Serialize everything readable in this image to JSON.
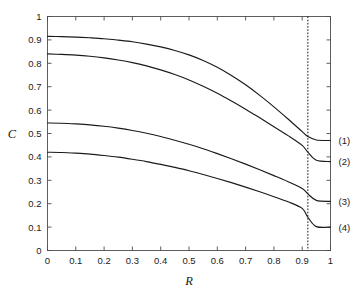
{
  "chart_data": {
    "type": "line",
    "title": "",
    "xlabel": "R",
    "ylabel": "C",
    "xlim": [
      0,
      1
    ],
    "ylim": [
      0,
      1
    ],
    "grid": false,
    "legend": "inline-right-labels",
    "xticks": [
      0,
      0.1,
      0.2,
      0.3,
      0.4,
      0.5,
      0.6,
      0.7,
      0.8,
      0.9,
      1
    ],
    "xticklabels": [
      "0",
      "0.1",
      "0.2",
      "0.3",
      "0.4",
      "0.5",
      "0.6",
      "0.7",
      "0.8",
      "0.9",
      "1"
    ],
    "yticks": [
      0,
      0.1,
      0.2,
      0.3,
      0.4,
      0.5,
      0.6,
      0.7,
      0.8,
      0.9,
      1
    ],
    "yticklabels": [
      "0",
      "0.1",
      "0.2",
      "0.3",
      "0.4",
      "0.5",
      "0.6",
      "0.7",
      "0.8",
      "0.9",
      "1"
    ],
    "annotations": [
      {
        "name": "vertical-dotted-line",
        "type": "vline",
        "x": 0.92,
        "style": "dotted"
      }
    ],
    "x": [
      0,
      0.05,
      0.1,
      0.15,
      0.2,
      0.25,
      0.3,
      0.35,
      0.4,
      0.45,
      0.5,
      0.55,
      0.6,
      0.65,
      0.7,
      0.75,
      0.8,
      0.85,
      0.9,
      0.92,
      0.95,
      1
    ],
    "series": [
      {
        "name": "(1)",
        "label": "(1)",
        "color": "#1a1a1a",
        "values": [
          0.915,
          0.914,
          0.912,
          0.909,
          0.905,
          0.899,
          0.892,
          0.882,
          0.87,
          0.855,
          0.836,
          0.812,
          0.783,
          0.748,
          0.708,
          0.663,
          0.614,
          0.562,
          0.508,
          0.487,
          0.472,
          0.47
        ]
      },
      {
        "name": "(2)",
        "label": "(2)",
        "color": "#1a1a1a",
        "values": [
          0.84,
          0.838,
          0.835,
          0.83,
          0.823,
          0.814,
          0.803,
          0.789,
          0.772,
          0.752,
          0.729,
          0.702,
          0.672,
          0.639,
          0.604,
          0.567,
          0.529,
          0.491,
          0.449,
          0.42,
          0.386,
          0.38
        ]
      },
      {
        "name": "(3)",
        "label": "(3)",
        "color": "#1a1a1a",
        "values": [
          0.545,
          0.544,
          0.541,
          0.537,
          0.531,
          0.523,
          0.513,
          0.501,
          0.487,
          0.471,
          0.454,
          0.435,
          0.414,
          0.392,
          0.369,
          0.345,
          0.32,
          0.294,
          0.265,
          0.242,
          0.214,
          0.21
        ]
      },
      {
        "name": "(4)",
        "label": "(4)",
        "color": "#1a1a1a",
        "values": [
          0.42,
          0.419,
          0.416,
          0.412,
          0.406,
          0.399,
          0.39,
          0.38,
          0.368,
          0.355,
          0.341,
          0.325,
          0.308,
          0.29,
          0.271,
          0.251,
          0.23,
          0.208,
          0.18,
          0.142,
          0.102,
          0.1
        ]
      }
    ]
  },
  "figure": {
    "background": "#ffffff",
    "axis_color": "#4d4d4d",
    "curve_color": "#1a1a1a"
  }
}
